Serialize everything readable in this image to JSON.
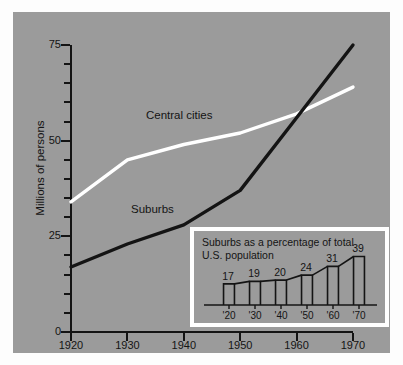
{
  "chart_data": {
    "type": "line",
    "title": "",
    "xlabel": "",
    "ylabel": "Millions of persons",
    "xlim": [
      1920,
      1970
    ],
    "ylim": [
      0,
      75
    ],
    "x": [
      1920,
      1930,
      1940,
      1950,
      1960,
      1970
    ],
    "y_ticks_major": [
      0,
      25,
      50,
      75
    ],
    "y_ticks_minor": [
      5,
      10,
      15,
      20,
      30,
      35,
      40,
      45,
      55,
      60,
      65,
      70
    ],
    "x_tick_labels": [
      "1920",
      "1930",
      "1940",
      "1950",
      "1960",
      "1970"
    ],
    "grid": false,
    "legend": "inline-labels",
    "series": [
      {
        "name": "Central cities",
        "color": "#ffffff",
        "values": [
          34,
          45,
          49,
          52,
          57,
          64
        ]
      },
      {
        "name": "Suburbs",
        "color": "#141414",
        "values": [
          17,
          23,
          28,
          37,
          56,
          75
        ]
      }
    ],
    "annotations": [
      {
        "text": "Central cities",
        "x": 1944,
        "y": 55
      },
      {
        "text": "Suburbs",
        "x": 1941,
        "y": 31
      }
    ],
    "inset": {
      "type": "bar",
      "title": "Suburbs as a percentage of total\nU.S. population",
      "categories": [
        "'20",
        "'30",
        "'40",
        "'50",
        "'60",
        "'70"
      ],
      "values": [
        17,
        19,
        20,
        24,
        31,
        39
      ],
      "value_labels": [
        "17",
        "19",
        "20",
        "24",
        "31",
        "39"
      ],
      "ylim": [
        0,
        45
      ],
      "xlabel": "",
      "ylabel": "",
      "grid": false
    }
  },
  "figure": {
    "background_color": "#9b9b9b",
    "page_color": "#ffffff",
    "ink_color": "#141414",
    "highlight_color": "#ffffff"
  }
}
